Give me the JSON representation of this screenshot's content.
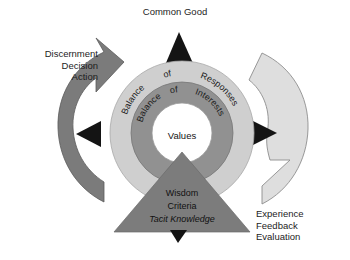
{
  "diagram": {
    "title": "Common Good",
    "background_color": "#ffffff",
    "center": {
      "label": "Values"
    },
    "rings": [
      {
        "name": "outer-ring",
        "color": "#cfcfcf",
        "words": [
          "Balance",
          "of",
          "Responses"
        ],
        "text": "Balance of Responses"
      },
      {
        "name": "inner-ring",
        "color": "#919191",
        "words": [
          "Balance",
          "of",
          "Interests"
        ],
        "text": "Balance of Interests"
      }
    ],
    "triangle": {
      "color": "#7c7c7c",
      "lines": [
        "Wisdom",
        "Criteria",
        "Tacit Knowledge"
      ],
      "italic_line": "Tacit Knowledge"
    },
    "left_cycle": {
      "color": "#7b7b7b",
      "lines": [
        "Discernment",
        "Decision",
        "Action"
      ]
    },
    "right_cycle": {
      "color": "#dedede",
      "lines": [
        "Experience",
        "Feedback",
        "Evaluation"
      ]
    },
    "pointers": {
      "color": "#141414",
      "up": "pointer-up",
      "down": "pointer-down",
      "left": "pointer-left",
      "right": "pointer-right"
    }
  }
}
